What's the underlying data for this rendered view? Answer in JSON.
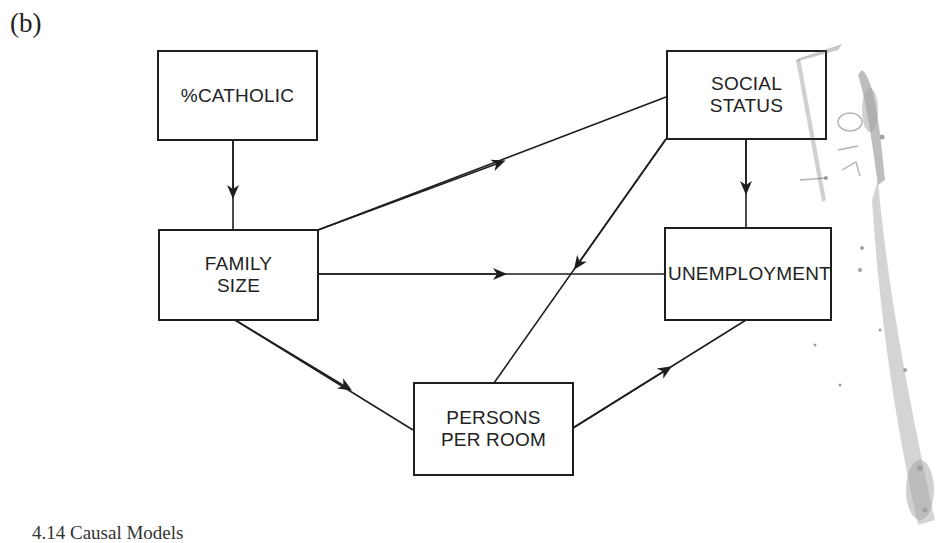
{
  "panel_label": "(b)",
  "nodes": {
    "catholic": {
      "label": "%CATHOLIC"
    },
    "social_status": {
      "label": "SOCIAL\nSTATUS"
    },
    "family_size": {
      "label": "FAMILY\nSIZE"
    },
    "unemployment": {
      "label": "UNEMPLOYMENT"
    },
    "persons_per_room": {
      "label": "PERSONS\nPER ROOM"
    }
  },
  "edges": [
    {
      "from": "%CATHOLIC",
      "to": "FAMILY SIZE"
    },
    {
      "from": "FAMILY SIZE",
      "to": "SOCIAL STATUS"
    },
    {
      "from": "FAMILY SIZE",
      "to": "UNEMPLOYMENT"
    },
    {
      "from": "FAMILY SIZE",
      "to": "PERSONS PER ROOM"
    },
    {
      "from": "SOCIAL STATUS",
      "to": "UNEMPLOYMENT"
    },
    {
      "from": "SOCIAL STATUS",
      "to": "PERSONS PER ROOM"
    },
    {
      "from": "PERSONS PER ROOM",
      "to": "UNEMPLOYMENT"
    }
  ],
  "caption": "4.14   Causal Models",
  "colors": {
    "ink": "#1e1e1e",
    "paper": "#ffffff",
    "stain": "#555555"
  }
}
